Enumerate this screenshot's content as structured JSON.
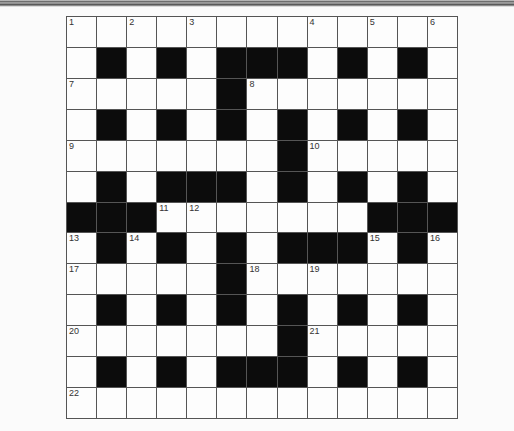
{
  "puzzle": {
    "rows": 13,
    "cols": 13,
    "pattern": [
      "WWWWWWWWWWWWW",
      "WBWBWBBBWBWBW",
      "WWWWWBWWWWWWW",
      "WBWBWBWBWBWBW",
      "WWWWWWWBWWWWW",
      "WBWBBBWBWBWBW",
      "BBBWWWWWWWBBB",
      "WBWBWBWBBBWBW",
      "WWWWWBWWWWWWW",
      "WBWBWBWBWBWBW",
      "WWWWWWWBWWWWW",
      "WBWBWBBBWBWBW",
      "WWWWWWWWWWWWW"
    ],
    "numbers": [
      {
        "r": 0,
        "c": 0,
        "n": "1"
      },
      {
        "r": 0,
        "c": 2,
        "n": "2"
      },
      {
        "r": 0,
        "c": 4,
        "n": "3"
      },
      {
        "r": 0,
        "c": 8,
        "n": "4"
      },
      {
        "r": 0,
        "c": 10,
        "n": "5"
      },
      {
        "r": 0,
        "c": 12,
        "n": "6"
      },
      {
        "r": 2,
        "c": 0,
        "n": "7"
      },
      {
        "r": 2,
        "c": 6,
        "n": "8"
      },
      {
        "r": 4,
        "c": 0,
        "n": "9"
      },
      {
        "r": 4,
        "c": 8,
        "n": "10"
      },
      {
        "r": 6,
        "c": 3,
        "n": "11"
      },
      {
        "r": 6,
        "c": 4,
        "n": "12"
      },
      {
        "r": 7,
        "c": 0,
        "n": "13"
      },
      {
        "r": 7,
        "c": 2,
        "n": "14"
      },
      {
        "r": 7,
        "c": 10,
        "n": "15"
      },
      {
        "r": 7,
        "c": 12,
        "n": "16"
      },
      {
        "r": 8,
        "c": 0,
        "n": "17"
      },
      {
        "r": 8,
        "c": 6,
        "n": "18"
      },
      {
        "r": 8,
        "c": 8,
        "n": "19"
      },
      {
        "r": 10,
        "c": 0,
        "n": "20"
      },
      {
        "r": 10,
        "c": 8,
        "n": "21"
      },
      {
        "r": 12,
        "c": 0,
        "n": "22"
      }
    ]
  }
}
